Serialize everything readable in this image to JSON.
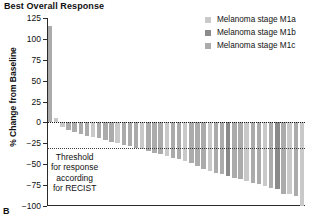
{
  "chart": {
    "title": "Best Overall Response",
    "panel_label": "B",
    "ylabel": "% Change from Baseline"
  },
  "legend": {
    "position": "top-right",
    "items": [
      {
        "label": "Melanoma stage M1a",
        "color": "#c9c9c9"
      },
      {
        "label": "Melanoma stage M1b",
        "color": "#8a8a8a"
      },
      {
        "label": "Melanoma stage M1c",
        "color": "#ababab"
      }
    ]
  },
  "annotation": {
    "lines": [
      "Threshold",
      "for response",
      "according",
      "for RECIST"
    ]
  },
  "chart_data": {
    "type": "bar",
    "title": "Best Overall Response",
    "xlabel": "",
    "ylabel": "% Change from Baseline",
    "ylim": [
      -100,
      125
    ],
    "yticks": [
      125,
      100,
      75,
      50,
      25,
      0,
      -25,
      -50,
      -75,
      -100
    ],
    "ytick_labels": [
      "125",
      "100",
      "75",
      "50",
      "25",
      "0",
      "−25",
      "−50",
      "−75",
      "−100"
    ],
    "grid": false,
    "orientation": "waterfall",
    "reference_lines": [
      {
        "value": 0,
        "style": "dotted",
        "label": ""
      },
      {
        "value": -30,
        "style": "dotted",
        "label": "Threshold for response according for RECIST"
      }
    ],
    "categories": [
      "1",
      "2",
      "3",
      "4",
      "5",
      "6",
      "7",
      "8",
      "9",
      "10",
      "11",
      "12",
      "13",
      "14",
      "15",
      "16",
      "17",
      "18",
      "19",
      "20",
      "21",
      "22",
      "23",
      "24",
      "25",
      "26",
      "27",
      "28",
      "29",
      "30",
      "31",
      "32",
      "33",
      "34",
      "35",
      "36",
      "37",
      "38",
      "39",
      "40",
      "41",
      "42"
    ],
    "values": [
      115,
      5,
      -6,
      -9,
      -12,
      -14,
      -16,
      -18,
      -19,
      -21,
      -23,
      -25,
      -27,
      -28,
      -30,
      -32,
      -34,
      -36,
      -38,
      -40,
      -42,
      -44,
      -46,
      -48,
      -52,
      -56,
      -58,
      -60,
      -62,
      -64,
      -66,
      -68,
      -70,
      -72,
      -74,
      -76,
      -78,
      -80,
      -86,
      -86,
      -88,
      -100
    ],
    "bar_groups": [
      "M1c",
      "M1a",
      "M1a",
      "M1c",
      "M1c",
      "M1c",
      "M1c",
      "M1a",
      "M1c",
      "M1c",
      "M1c",
      "M1a",
      "M1c",
      "M1c",
      "M1c",
      "M1a",
      "M1c",
      "M1c",
      "M1c",
      "M1a",
      "M1c",
      "M1c",
      "M1a",
      "M1c",
      "M1c",
      "M1c",
      "M1a",
      "M1c",
      "M1c",
      "M1b",
      "M1c",
      "M1c",
      "M1a",
      "M1c",
      "M1c",
      "M1a",
      "M1c",
      "M1b",
      "M1c",
      "M1a",
      "M1c",
      "M1a"
    ],
    "group_colors": {
      "M1a": "#c9c9c9",
      "M1b": "#8a8a8a",
      "M1c": "#ababab"
    },
    "series": [
      {
        "name": "Melanoma stage M1a",
        "color": "#c9c9c9"
      },
      {
        "name": "Melanoma stage M1b",
        "color": "#8a8a8a"
      },
      {
        "name": "Melanoma stage M1c",
        "color": "#ababab"
      }
    ]
  }
}
